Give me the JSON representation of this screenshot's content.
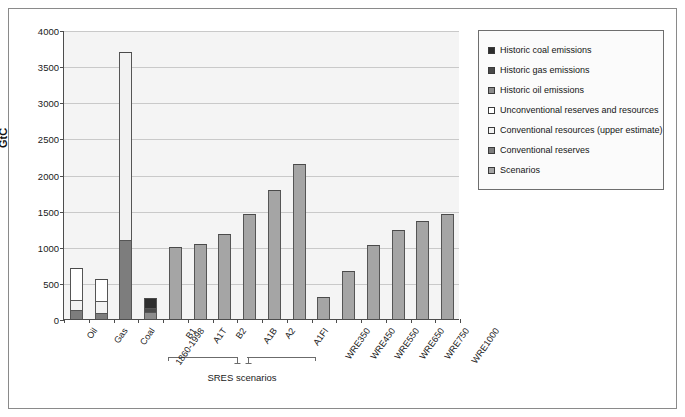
{
  "chart_data": {
    "type": "bar",
    "title": "",
    "xlabel": "",
    "ylabel": "GtC",
    "ylim": [
      0,
      4000
    ],
    "ytick_values": [
      0,
      500,
      1000,
      1500,
      2000,
      2500,
      3000,
      3500,
      4000
    ],
    "ytick_labels": [
      "0",
      "500",
      "1000",
      "1500",
      "2000",
      "2500",
      "3000",
      "3500",
      "4000"
    ],
    "grid": true,
    "legend_position": "right",
    "stacked": true,
    "series": [
      {
        "name": "Historic coal emissions",
        "color": "#2e2e2e"
      },
      {
        "name": "Historic gas emissions",
        "color": "#4a4a4a"
      },
      {
        "name": "Historic oil emissions",
        "color": "#8c8c8c"
      },
      {
        "name": "Unconventional reserves and resources",
        "color": "#ffffff"
      },
      {
        "name": "Conventional resources (upper estimate)",
        "color": "#f2f2f2"
      },
      {
        "name": "Conventional reserves",
        "color": "#7d7d7d"
      },
      {
        "name": "Scenarios",
        "color": "#a5a5a5"
      }
    ],
    "categories": [
      "Oil",
      "Gas",
      "Coal",
      "1860-1998",
      "B1",
      "A1T",
      "B2",
      "A1B",
      "A2",
      "A1FI",
      "WRE350",
      "WRE450",
      "WRE550",
      "WRE650",
      "WRE750",
      "WRE1000"
    ],
    "bars": [
      {
        "label": "Oil",
        "total": 710,
        "segments": [
          {
            "series": "Conventional reserves",
            "value": 120
          },
          {
            "series": "Conventional resources (upper estimate)",
            "value": 150
          },
          {
            "series": "Unconventional reserves and resources",
            "value": 440
          }
        ]
      },
      {
        "label": "Gas",
        "total": 555,
        "segments": [
          {
            "series": "Conventional reserves",
            "value": 90
          },
          {
            "series": "Conventional resources (upper estimate)",
            "value": 165
          },
          {
            "series": "Unconventional reserves and resources",
            "value": 300
          }
        ]
      },
      {
        "label": "Coal",
        "total": 3700,
        "segments": [
          {
            "series": "Conventional reserves",
            "value": 1100
          },
          {
            "series": "Conventional resources (upper estimate)",
            "value": 2600
          }
        ]
      },
      {
        "label": "1860-1998",
        "total": 290,
        "segments": [
          {
            "series": "Historic oil emissions",
            "value": 100
          },
          {
            "series": "Historic gas emissions",
            "value": 50
          },
          {
            "series": "Historic coal emissions",
            "value": 140
          }
        ]
      },
      {
        "label": "B1",
        "total": 1000,
        "segments": [
          {
            "series": "Scenarios",
            "value": 1000
          }
        ]
      },
      {
        "label": "A1T",
        "total": 1040,
        "segments": [
          {
            "series": "Scenarios",
            "value": 1040
          }
        ]
      },
      {
        "label": "B2",
        "total": 1170,
        "segments": [
          {
            "series": "Scenarios",
            "value": 1170
          }
        ]
      },
      {
        "label": "A1B",
        "total": 1450,
        "segments": [
          {
            "series": "Scenarios",
            "value": 1450
          }
        ]
      },
      {
        "label": "A2",
        "total": 1780,
        "segments": [
          {
            "series": "Scenarios",
            "value": 1780
          }
        ]
      },
      {
        "label": "A1FI",
        "total": 2140,
        "segments": [
          {
            "series": "Scenarios",
            "value": 2140
          }
        ]
      },
      {
        "label": "WRE350",
        "total": 300,
        "segments": [
          {
            "series": "Scenarios",
            "value": 300
          }
        ]
      },
      {
        "label": "WRE450",
        "total": 670,
        "segments": [
          {
            "series": "Scenarios",
            "value": 670
          }
        ]
      },
      {
        "label": "WRE550",
        "total": 1030,
        "segments": [
          {
            "series": "Scenarios",
            "value": 1030
          }
        ]
      },
      {
        "label": "WRE650",
        "total": 1230,
        "segments": [
          {
            "series": "Scenarios",
            "value": 1230
          }
        ]
      },
      {
        "label": "WRE750",
        "total": 1350,
        "segments": [
          {
            "series": "Scenarios",
            "value": 1350
          }
        ]
      },
      {
        "label": "WRE1000",
        "total": 1450,
        "segments": [
          {
            "series": "Scenarios",
            "value": 1450
          }
        ]
      }
    ],
    "annotations": [
      {
        "text": "SRES scenarios",
        "covers": [
          "B1",
          "A1T",
          "B2",
          "A1B",
          "A2",
          "A1FI"
        ]
      }
    ]
  },
  "legend": {
    "items": [
      {
        "label": "Historic coal emissions",
        "color": "#2e2e2e"
      },
      {
        "label": "Historic gas emissions",
        "color": "#4a4a4a"
      },
      {
        "label": "Historic oil emissions",
        "color": "#8c8c8c"
      },
      {
        "label": "Unconventional reserves and resources",
        "color": "#ffffff"
      },
      {
        "label": "Conventional resources (upper estimate)",
        "color": "#f2f2f2"
      },
      {
        "label": "Conventional reserves",
        "color": "#7d7d7d"
      },
      {
        "label": "Scenarios",
        "color": "#a5a5a5"
      }
    ]
  },
  "axis": {
    "y_title": "GtC"
  },
  "brace": {
    "caption": "SRES scenarios"
  }
}
